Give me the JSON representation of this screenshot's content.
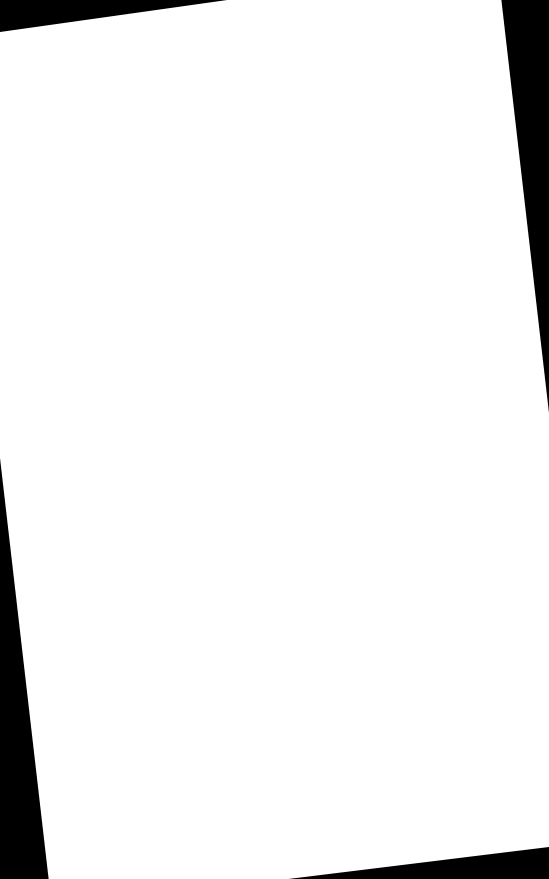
{
  "document": {
    "page": {
      "background": "#ffffff",
      "rotation_deg": -7,
      "content": ""
    },
    "backdrop": {
      "color": "#000000"
    }
  }
}
